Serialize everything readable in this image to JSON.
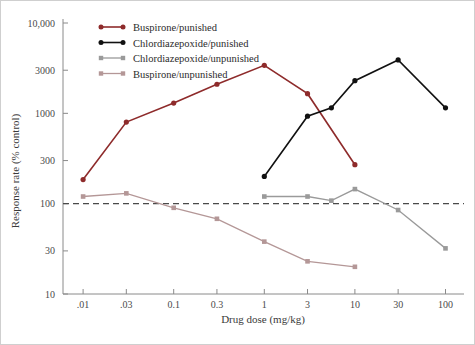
{
  "chart_data": {
    "type": "line",
    "title": "",
    "xlabel": "Drug dose (mg/kg)",
    "ylabel": "Response rate (% control)",
    "x_scale": "log",
    "y_scale": "log",
    "x_tick_labels": [
      ".01",
      ".03",
      "0.1",
      "0.3",
      "1",
      "3",
      "10",
      "30",
      "100"
    ],
    "x_tick_values": [
      0.01,
      0.03,
      0.1,
      0.3,
      1,
      3,
      10,
      30,
      100
    ],
    "y_tick_labels": [
      "10,000",
      "3000",
      "1000",
      "300",
      "100",
      "30",
      "10"
    ],
    "y_tick_values": [
      10000,
      3000,
      1000,
      300,
      100,
      30,
      10
    ],
    "xlim": [
      0.006,
      160
    ],
    "ylim": [
      10,
      10000
    ],
    "grid": false,
    "legend_position": "top-left",
    "reference_line": {
      "y": 100,
      "style": "dashed",
      "label": ""
    },
    "series": [
      {
        "name": "Buspirone/punished",
        "color": "#8e2b2b",
        "marker": "circle",
        "x": [
          0.01,
          0.03,
          0.1,
          0.3,
          1,
          3,
          10
        ],
        "values": [
          185,
          800,
          1300,
          2100,
          3400,
          1650,
          270
        ]
      },
      {
        "name": "Chlordiazepoxide/punished",
        "color": "#111111",
        "marker": "circle",
        "x": [
          1,
          3,
          5.5,
          10,
          30,
          100
        ],
        "values": [
          200,
          930,
          1150,
          2300,
          3900,
          1150
        ]
      },
      {
        "name": "Chlordiazepoxide/unpunished",
        "color": "#9a9a9a",
        "marker": "square",
        "x": [
          1,
          3,
          5.5,
          10,
          30,
          100
        ],
        "values": [
          120,
          120,
          108,
          145,
          85,
          32
        ]
      },
      {
        "name": "Buspirone/unpunished",
        "color": "#b49797",
        "marker": "square",
        "x": [
          0.01,
          0.03,
          0.1,
          0.3,
          1,
          3,
          10
        ],
        "values": [
          120,
          130,
          90,
          68,
          38,
          23,
          20
        ]
      }
    ]
  },
  "legend": {
    "entries": [
      {
        "label": "Buspirone/punished",
        "color": "#8e2b2b"
      },
      {
        "label": "Chlordiazepoxide/punished",
        "color": "#111111"
      },
      {
        "label": "Chlordiazepoxide/unpunished",
        "color": "#9a9a9a"
      },
      {
        "label": "Buspirone/unpunished",
        "color": "#b49797"
      }
    ]
  }
}
